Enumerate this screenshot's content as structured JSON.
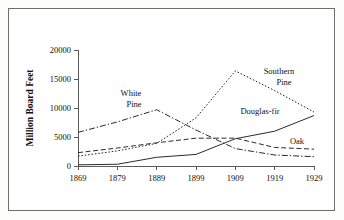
{
  "chart_data": {
    "type": "line",
    "title": "",
    "xlabel": "",
    "ylabel": "Million Board Feet",
    "categories": [
      "1869",
      "1879",
      "1889",
      "1899",
      "1909",
      "1919",
      "1929"
    ],
    "x": [
      1869,
      1879,
      1889,
      1899,
      1909,
      1919,
      1929
    ],
    "xlim": [
      1869,
      1929
    ],
    "ylim": [
      0,
      20000
    ],
    "y_ticks": [
      "0",
      "5000",
      "10000",
      "15000",
      "20000"
    ],
    "y_tick_values": [
      0,
      5000,
      10000,
      15000,
      20000
    ],
    "grid": false,
    "legend_position": "inline-annotations",
    "series": [
      {
        "name": "White Pine",
        "style": "dash-dot",
        "color": "#2b2b2b",
        "values": [
          5800,
          7600,
          9700,
          6200,
          3000,
          1900,
          1600
        ]
      },
      {
        "name": "Southern Pine",
        "style": "dotted",
        "color": "#2b2b2b",
        "values": [
          1700,
          2600,
          3900,
          8300,
          16400,
          13000,
          9300
        ]
      },
      {
        "name": "Douglas-fir",
        "style": "solid",
        "color": "#2b2b2b",
        "values": [
          200,
          300,
          1500,
          2000,
          4700,
          6000,
          8700
        ]
      },
      {
        "name": "Oak",
        "style": "dashed",
        "color": "#2b2b2b",
        "values": [
          2300,
          3100,
          4000,
          4800,
          4800,
          3200,
          2900
        ]
      }
    ],
    "annotations": [
      {
        "text": "White",
        "series": "White Pine",
        "x_px": 130,
        "y_px": 95
      },
      {
        "text": "Pine",
        "series": "White Pine",
        "x_px": 133,
        "y_px": 106
      },
      {
        "text": "Southern",
        "series": "Southern Pine",
        "x_px": 278,
        "y_px": 73
      },
      {
        "text": "Pine",
        "series": "Southern Pine",
        "x_px": 283,
        "y_px": 84
      },
      {
        "text": "Douglas-fir",
        "series": "Douglas-fir",
        "x_px": 259,
        "y_px": 113
      },
      {
        "text": "Oak",
        "series": "Oak",
        "x_px": 296,
        "y_px": 143
      }
    ]
  },
  "figure": {
    "border_color": "#6e6e6e",
    "axis_color": "#5a5a5a",
    "line_color": "#2b2b2b",
    "background": "#ffffff"
  }
}
